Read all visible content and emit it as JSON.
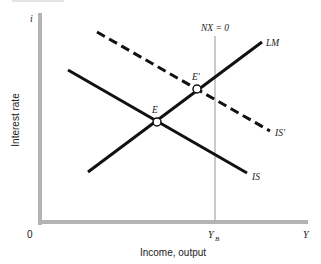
{
  "diagram": {
    "type": "IS-LM-BP",
    "axes": {
      "y_symbol": "i",
      "y_label": "Interest rate",
      "x_symbol": "Y",
      "x_label": "Income, output",
      "origin": "0",
      "x_tick": "Y",
      "x_tick_sub": "B"
    },
    "curves": {
      "lm": {
        "label": "LM",
        "style": "solid"
      },
      "is": {
        "label": "IS",
        "style": "solid"
      },
      "is_prime": {
        "label": "IS′",
        "style": "dashed"
      },
      "nx": {
        "label": "NX = 0",
        "style": "vertical"
      }
    },
    "points": {
      "e": {
        "label": "E"
      },
      "e_prime": {
        "label": "E′"
      }
    },
    "colors": {
      "axis": "#b4b4b4",
      "curve": "#111111",
      "nx_line": "#a8a8a8",
      "text": "#222222"
    }
  }
}
